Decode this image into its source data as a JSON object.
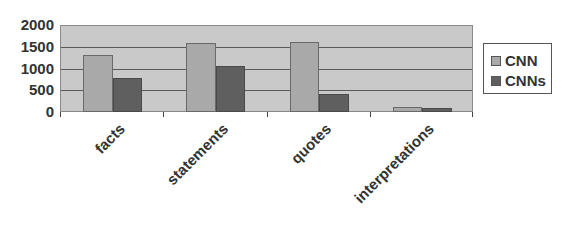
{
  "chart_data": {
    "type": "bar",
    "title": "",
    "xlabel": "",
    "ylabel": "",
    "categories": [
      "facts",
      "statements",
      "quotes",
      "interpretations"
    ],
    "series": [
      {
        "name": "CNN",
        "values": [
          1300,
          1580,
          1600,
          110
        ],
        "color": "#a9a9a9"
      },
      {
        "name": "CNNs",
        "values": [
          780,
          1060,
          410,
          90
        ],
        "color": "#5f5f5f"
      }
    ],
    "ylim": [
      0,
      2000
    ],
    "yticks": [
      "0",
      "500",
      "1000",
      "1500",
      "2000"
    ],
    "grid": true,
    "legend_position": "right"
  },
  "legend": {
    "items": [
      {
        "label": "CNN",
        "color": "#a9a9a9"
      },
      {
        "label": "CNNs",
        "color": "#5f5f5f"
      }
    ]
  }
}
